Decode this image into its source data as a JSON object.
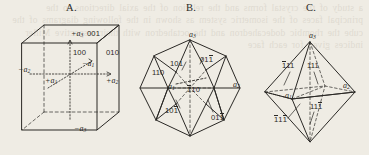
{
  "figure": {
    "background_color": "#efece4",
    "ink_color": "#2a2825",
    "bleed_text": "a study of the crystal forms and the relation of the axial directions to the principal faces of the isometric system as shown in the following diagrams of the cube the rhombic dodecahedron and the octahedron with their respective Miller indices given for each face"
  },
  "panels": [
    {
      "id": "A",
      "letter": "A.",
      "name": "cube",
      "axis_labels": [
        {
          "text": "+a",
          "sub": "3",
          "x": 71,
          "y": 33
        },
        {
          "text": "−a",
          "sub": "3",
          "x": 77,
          "y": 128
        },
        {
          "text": "+a",
          "sub": "1",
          "x": 48,
          "y": 79
        },
        {
          "text": "−a",
          "sub": "1",
          "x": 84,
          "y": 65
        },
        {
          "text": "+a",
          "sub": "2",
          "x": 110,
          "y": 80
        },
        {
          "text": "−a",
          "sub": "2",
          "x": 20,
          "y": 69
        }
      ],
      "face_indices": [
        {
          "text": "001",
          "bars": [],
          "x": 87,
          "y": 33
        },
        {
          "text": "100",
          "bars": [],
          "x": 73,
          "y": 52
        },
        {
          "text": "010",
          "bars": [],
          "x": 107,
          "y": 52
        }
      ]
    },
    {
      "id": "B",
      "letter": "B.",
      "name": "rhombic-dodecahedron",
      "axis_labels": [
        {
          "text": "a",
          "sub": "3",
          "x": 190,
          "y": 35
        },
        {
          "text": "a",
          "sub": "1",
          "x": 171,
          "y": 86
        },
        {
          "text": "a",
          "sub": "2",
          "x": 234,
          "y": 84
        }
      ],
      "face_indices": [
        {
          "text": "101",
          "bars": [],
          "x": 174,
          "y": 63
        },
        {
          "text": "011",
          "bars": [
            2
          ],
          "x": 203,
          "y": 59
        },
        {
          "text": "110",
          "bars": [],
          "x": 156,
          "y": 72
        },
        {
          "text": "110",
          "bars": [
            1
          ],
          "x": 190,
          "y": 89
        },
        {
          "text": "101",
          "bars": [
            2
          ],
          "x": 168,
          "y": 110
        },
        {
          "text": "011",
          "bars": [
            2
          ],
          "x": 214,
          "y": 117
        }
      ]
    },
    {
      "id": "C",
      "letter": "C.",
      "name": "octahedron",
      "axis_labels": [
        {
          "text": "a",
          "sub": "3",
          "x": 310,
          "y": 36
        },
        {
          "text": "a",
          "sub": "1",
          "x": 288,
          "y": 95
        },
        {
          "text": "a",
          "sub": "2",
          "x": 344,
          "y": 85
        }
      ],
      "face_indices": [
        {
          "text": "111",
          "bars": [
            1
          ],
          "x": 285,
          "y": 65
        },
        {
          "text": "111",
          "bars": [],
          "x": 309,
          "y": 65
        },
        {
          "text": "111",
          "bars": [
            2
          ],
          "x": 312,
          "y": 106
        },
        {
          "text": "111",
          "bars": [
            1,
            2
          ],
          "x": 277,
          "y": 119
        }
      ]
    }
  ]
}
